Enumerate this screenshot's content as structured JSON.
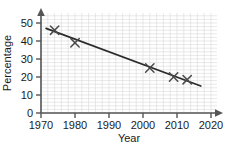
{
  "chart_data": {
    "type": "scatter",
    "title": "",
    "xlabel": "Year",
    "ylabel": "Percentage",
    "xlim": [
      1970,
      2022
    ],
    "ylim": [
      0,
      56
    ],
    "xticks": [
      1970,
      1980,
      1990,
      2000,
      2010,
      2020
    ],
    "xtick_labels": [
      "1970",
      "1980",
      "1990",
      "2000",
      "2010",
      "2020"
    ],
    "yticks": [
      0,
      10,
      20,
      30,
      40,
      50
    ],
    "ytick_labels": [
      "0",
      "10",
      "20",
      "30",
      "40",
      "50"
    ],
    "grid": true,
    "grid_minor_step_x": 2,
    "grid_minor_step_y": 2,
    "grid_color": "#d8d8d8",
    "axis_color": "#555555",
    "marker": "x",
    "marker_color": "#4a4a4a",
    "legend": "none",
    "points": [
      {
        "x": 1974,
        "y": 46
      },
      {
        "x": 1980,
        "y": 39
      },
      {
        "x": 2002,
        "y": 25
      },
      {
        "x": 2009,
        "y": 20
      },
      {
        "x": 2013,
        "y": 18.5
      }
    ],
    "trend_line": {
      "name": "line of best fit",
      "color": "#2b2b2b",
      "x_start": 1971.5,
      "y_start": 47,
      "x_end": 2017,
      "y_end": 15
    }
  }
}
